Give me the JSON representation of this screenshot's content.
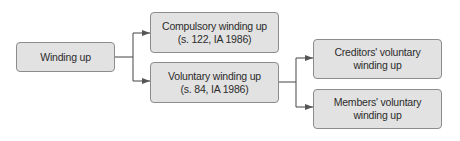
{
  "diagram": {
    "type": "flowchart",
    "nodes": {
      "root": {
        "lines": [
          "Winding up"
        ]
      },
      "compulsory": {
        "lines": [
          "Compulsory winding up",
          "(s. 122, IA 1986)"
        ]
      },
      "voluntary": {
        "lines": [
          "Voluntary winding up",
          "(s. 84, IA 1986)"
        ]
      },
      "creditors": {
        "lines": [
          "Creditors' voluntary",
          "winding up"
        ]
      },
      "members": {
        "lines": [
          "Members' voluntary",
          "winding up"
        ]
      }
    },
    "edges": [
      {
        "from": "root",
        "to": "compulsory"
      },
      {
        "from": "root",
        "to": "voluntary"
      },
      {
        "from": "voluntary",
        "to": "creditors"
      },
      {
        "from": "voluntary",
        "to": "members"
      }
    ],
    "colors": {
      "box_fill": "#e2e2e2",
      "box_border": "#8c8c8c",
      "connector": "#555555",
      "text": "#2c2c2c"
    }
  }
}
